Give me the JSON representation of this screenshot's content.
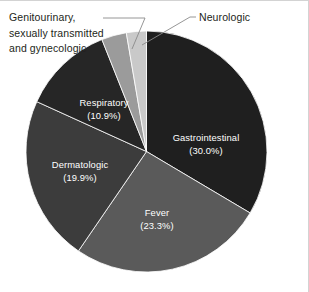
{
  "figure": {
    "background_color": "#ffffff",
    "border_color": "#d3d3d3",
    "label_text_color": "#231f20",
    "slice_label_color": "#ffffff",
    "leader_line_color": "#808080"
  },
  "chart_data": {
    "type": "pie",
    "title": "",
    "xlabel": "",
    "ylabel": "",
    "legend_position": "none",
    "grid": false,
    "label_format": "name (percent%)",
    "start_angle_deg": 0,
    "direction": "clockwise",
    "categories": [
      "Gastrointestinal",
      "Fever",
      "Dermatologic",
      "Respiratory",
      "Genitourinary, sexually transmitted and gynecologic",
      "Neurologic"
    ],
    "values": [
      30.0,
      23.3,
      19.9,
      10.9,
      3.0,
      2.4
    ],
    "units": "percent",
    "slices": [
      {
        "name": "Gastrointestinal",
        "value": 30.0,
        "percent_label": "(30.0%)",
        "color": "#1f1f1f",
        "label_placement": "inside",
        "label_line1": "Gastrointestinal",
        "label_line2": "(30.0%)"
      },
      {
        "name": "Fever",
        "value": 23.3,
        "percent_label": "(23.3%)",
        "color": "#5a5a5a",
        "label_placement": "inside",
        "label_line1": "Fever",
        "label_line2": "(23.3%)"
      },
      {
        "name": "Dermatologic",
        "value": 19.9,
        "percent_label": "(19.9%)",
        "color": "#3c3c3c",
        "label_placement": "inside",
        "label_line1": "Dermatologic",
        "label_line2": "(19.9%)"
      },
      {
        "name": "Respiratory",
        "value": 10.9,
        "percent_label": "(10.9%)",
        "color": "#262626",
        "label_placement": "inside",
        "label_line1": "Respiratory",
        "label_line2": "(10.9%)"
      },
      {
        "name": "Genitourinary, sexually transmitted and gynecologic",
        "value": 3.0,
        "percent_label": "",
        "color": "#9b9b9b",
        "label_placement": "callout",
        "label_line1": "Genitourinary,",
        "label_line2": "sexually transmitted",
        "label_line3": "and gynecologic"
      },
      {
        "name": "Neurologic",
        "value": 2.4,
        "percent_label": "",
        "color": "#c9c9c9",
        "label_placement": "callout",
        "label_line1": "Neurologic"
      }
    ]
  },
  "callouts": {
    "genitourinary": "Genitourinary,\nsexually transmitted\nand gynecologic",
    "neurologic": "Neurologic"
  },
  "slice_labels": {
    "gastrointestinal": "Gastrointestinal\n(30.0%)",
    "fever": "Fever\n(23.3%)",
    "dermatologic": "Dermatologic\n(19.9%)",
    "respiratory": "Respiratory\n(10.9%)"
  }
}
